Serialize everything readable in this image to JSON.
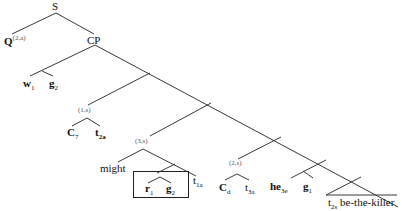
{
  "tree": {
    "root": "S",
    "q_label": "Q",
    "q_sup": "(2,a)",
    "cp": "CP",
    "w": {
      "base": "w",
      "sub": "1"
    },
    "g2a": {
      "base": "g",
      "sub": "2"
    },
    "idx1": "(1,s)",
    "c7": {
      "base": "C",
      "sub": "7"
    },
    "t2a": {
      "base": "t",
      "sub": "2a"
    },
    "idx3": "(3,s)",
    "might": "might",
    "r1": {
      "base": "r",
      "sub": "1"
    },
    "g2b": {
      "base": "g",
      "sub": "2"
    },
    "t1a": {
      "base": "t",
      "sub": "1a"
    },
    "idx2": "(2,s)",
    "cd": {
      "base": "C",
      "sub": "d"
    },
    "t3a": {
      "base": "t",
      "sub": "3a"
    },
    "he": {
      "base": "he",
      "sub": "3e"
    },
    "g1": {
      "base": "g",
      "sub": "1"
    },
    "t2s": {
      "base": "t",
      "sub": "2s"
    },
    "killer": "be-the-killer"
  }
}
